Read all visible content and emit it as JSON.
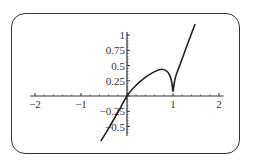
{
  "chart_data": {
    "type": "line",
    "title": "",
    "xlabel": "",
    "ylabel": "",
    "xlim": [
      -2.1,
      2.1
    ],
    "ylim": [
      -0.65,
      1.05
    ],
    "grid": false,
    "legend": null,
    "x_ticks": [
      -2,
      -1,
      1,
      2
    ],
    "x_tick_labels": [
      "−2",
      "−1",
      "1",
      "2"
    ],
    "y_ticks": [
      1,
      0.75,
      0.5,
      0.25,
      -0.25,
      -0.5
    ],
    "y_tick_labels": [
      "1",
      "0.75",
      "0.5",
      "0.25",
      "−0.25",
      "−0.5"
    ],
    "series": [
      {
        "name": "f(x)",
        "color": "#222222",
        "x": [
          -0.57,
          -0.4,
          -0.2,
          0.0,
          0.15,
          0.39,
          0.6,
          0.76,
          0.89,
          0.96,
          1.0,
          1.05,
          1.15,
          1.3,
          1.48
        ],
        "y": [
          -0.74,
          -0.53,
          -0.27,
          0.0,
          0.14,
          0.3,
          0.4,
          0.44,
          0.39,
          0.27,
          0.07,
          0.3,
          0.51,
          0.82,
          1.18
        ],
        "cusp_at": [
          1.0,
          0.07
        ]
      }
    ]
  },
  "colors": {
    "frame": "#333333",
    "axis": "#333333",
    "curve": "#222222",
    "background": "#ffffff"
  }
}
